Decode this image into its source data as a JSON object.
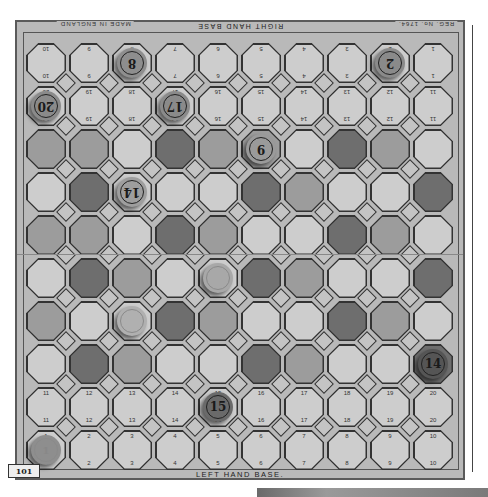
{
  "board": {
    "title_top": "RIGHT HAND BASE",
    "title_bottom": "LEFT HAND BASE.",
    "maker_text": "MADE IN ENGLAND",
    "corner_text": "REG. No. 1764.",
    "plate_number": "101",
    "colors": {
      "dark": "#6e6e6e",
      "medium": "#9c9c9c",
      "light": "#cdcdcd",
      "board_bg": "#b9b9b9",
      "diamond": "#c4c4c4"
    },
    "rows": [
      {
        "shades": [
          "L",
          "L",
          "L",
          "L",
          "L",
          "L",
          "L",
          "L",
          "L",
          "L"
        ],
        "top_numbers": [
          "10",
          "9",
          "8",
          "7",
          "6",
          "5",
          "4",
          "3",
          "2",
          "1"
        ],
        "bottom_numbers": [
          "10",
          "9",
          "8",
          "7",
          "6",
          "5",
          "4",
          "3",
          "2",
          "1"
        ],
        "numbers_flipped": true
      },
      {
        "shades": [
          "L",
          "L",
          "L",
          "L",
          "L",
          "L",
          "L",
          "L",
          "L",
          "L"
        ],
        "top_numbers": [
          "20",
          "19",
          "18",
          "17",
          "16",
          "15",
          "14",
          "13",
          "12",
          "11"
        ],
        "bottom_numbers": [
          "20",
          "19",
          "18",
          "17",
          "16",
          "15",
          "14",
          "13",
          "12",
          "11"
        ],
        "numbers_flipped": true
      },
      {
        "shades": [
          "M",
          "M",
          "L",
          "D",
          "M",
          "M",
          "L",
          "D",
          "M",
          "L"
        ]
      },
      {
        "shades": [
          "L",
          "D",
          "L",
          "L",
          "L",
          "D",
          "M",
          "L",
          "L",
          "D"
        ]
      },
      {
        "shades": [
          "M",
          "M",
          "L",
          "D",
          "M",
          "L",
          "L",
          "D",
          "M",
          "L"
        ]
      },
      {
        "shades": [
          "L",
          "D",
          "M",
          "L",
          "L",
          "D",
          "M",
          "L",
          "L",
          "D"
        ]
      },
      {
        "shades": [
          "M",
          "L",
          "L",
          "D",
          "M",
          "L",
          "L",
          "D",
          "M",
          "L"
        ]
      },
      {
        "shades": [
          "L",
          "D",
          "M",
          "L",
          "L",
          "D",
          "M",
          "L",
          "L",
          "D"
        ]
      },
      {
        "shades": [
          "L",
          "L",
          "L",
          "L",
          "L",
          "L",
          "L",
          "L",
          "L",
          "L"
        ],
        "top_numbers": [
          "11",
          "12",
          "13",
          "14",
          "15",
          "16",
          "17",
          "18",
          "19",
          "20"
        ],
        "bottom_numbers": [
          "11",
          "12",
          "13",
          "14",
          "15",
          "16",
          "17",
          "18",
          "19",
          "20"
        ],
        "numbers_flipped": false
      },
      {
        "shades": [
          "L",
          "L",
          "L",
          "L",
          "L",
          "L",
          "L",
          "L",
          "L",
          "L"
        ],
        "top_numbers": [
          "1",
          "2",
          "3",
          "4",
          "5",
          "6",
          "7",
          "8",
          "9",
          "10"
        ],
        "bottom_numbers": [
          "1",
          "2",
          "3",
          "4",
          "5",
          "6",
          "7",
          "8",
          "9",
          "10"
        ],
        "numbers_flipped": false
      }
    ]
  },
  "pieces": [
    {
      "label": "8",
      "row": 0,
      "col": 2,
      "color": "#8e8e8e",
      "flipped": true,
      "faded": false
    },
    {
      "label": "2",
      "row": 0,
      "col": 8,
      "color": "#8a8a8a",
      "flipped": true,
      "faded": false
    },
    {
      "label": "20",
      "row": 1,
      "col": 0,
      "color": "#8a8a8a",
      "flipped": true,
      "faded": false
    },
    {
      "label": "17",
      "row": 1,
      "col": 3,
      "color": "#8a8a8a",
      "flipped": true,
      "faded": false
    },
    {
      "label": "9",
      "row": 2,
      "col": 5,
      "color": "#9a9a9a",
      "flipped": true,
      "faded": false
    },
    {
      "label": "14",
      "row": 3,
      "col": 2,
      "color": "#9e9e9e",
      "flipped": true,
      "faded": false
    },
    {
      "label": "?",
      "row": 5,
      "col": 4,
      "color": "#a8a8a8",
      "flipped": true,
      "faded": true
    },
    {
      "label": "?",
      "row": 6,
      "col": 2,
      "color": "#b0b0b0",
      "flipped": false,
      "faded": true
    },
    {
      "label": "14",
      "row": 7,
      "col": 9,
      "color": "#555555",
      "flipped": false,
      "faded": false
    },
    {
      "label": "15",
      "row": 8,
      "col": 4,
      "color": "#6a6a6a",
      "flipped": false,
      "faded": false
    },
    {
      "label": "1",
      "row": 9,
      "col": 0,
      "color": "#8e8e8e",
      "flipped": false,
      "faded": true
    }
  ]
}
